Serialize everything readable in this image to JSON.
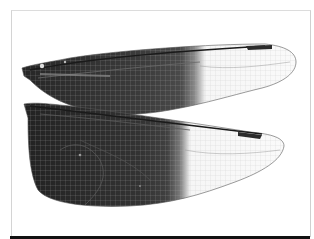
{
  "image": {
    "subject": "dragonfly wings specimen",
    "description": "Pair of dragonfly wings (forewing above, hindwing below) with dark pigmented basal half and clear venated distal half, dark pterostigma near each tip",
    "colors": {
      "background": "#ffffff",
      "frame": "#d4d4d4",
      "wing_dark": "#2a2a2a",
      "wing_dark_light": "#4a4a4a",
      "wing_clear": "#fafafa",
      "vein": "#9a9a9a",
      "pterostigma": "#2b2b2b",
      "bottom_bar": "#111111"
    }
  }
}
